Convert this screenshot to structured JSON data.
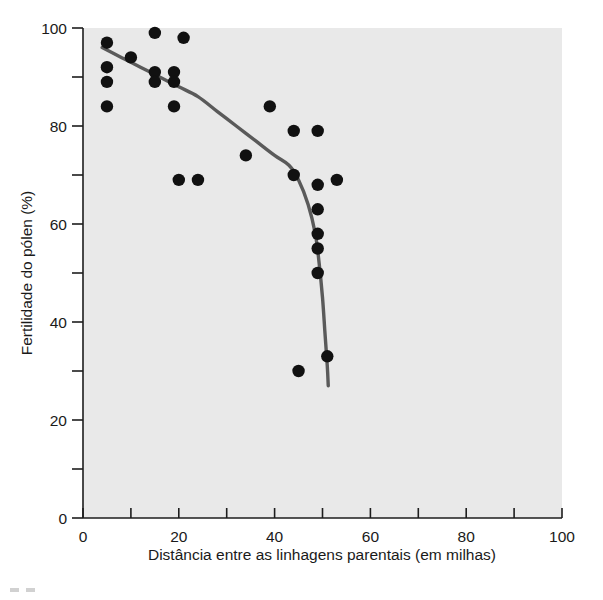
{
  "figure": {
    "background_color": "#ffffff",
    "plot_background_color": "#e9e9e9",
    "point_color": "#111111",
    "curve_color": "#5a5a5a",
    "axis_color": "#1d1d1d"
  },
  "chart_data": {
    "type": "scatter",
    "title": "",
    "xlabel": "Distância entre as linhagens parentais (em milhas)",
    "ylabel": "Fertilidade do pólen (%)",
    "xlim": [
      0,
      100
    ],
    "ylim": [
      0,
      100
    ],
    "grid": false,
    "legend": "none",
    "x_major_ticks": [
      0,
      20,
      40,
      60,
      80,
      100
    ],
    "x_minor_ticks": [
      10,
      30,
      50,
      70,
      90
    ],
    "x_tick_labels": [
      "0",
      "20",
      "40",
      "60",
      "80",
      "100"
    ],
    "y_major_ticks": [
      0,
      20,
      40,
      60,
      80,
      100
    ],
    "y_minor_ticks": [
      10,
      30,
      50,
      70,
      90
    ],
    "y_tick_labels": [
      "0",
      "20",
      "40",
      "60",
      "80",
      "100"
    ],
    "series": [
      {
        "name": "Fertilidade do pólen",
        "marker": "filled-circle",
        "points": [
          {
            "x": 5,
            "y": 97
          },
          {
            "x": 5,
            "y": 92
          },
          {
            "x": 5,
            "y": 89
          },
          {
            "x": 5,
            "y": 84
          },
          {
            "x": 10,
            "y": 94
          },
          {
            "x": 15,
            "y": 99
          },
          {
            "x": 15,
            "y": 91
          },
          {
            "x": 15,
            "y": 89
          },
          {
            "x": 19,
            "y": 91
          },
          {
            "x": 19,
            "y": 89
          },
          {
            "x": 19,
            "y": 84
          },
          {
            "x": 20,
            "y": 69
          },
          {
            "x": 21,
            "y": 98
          },
          {
            "x": 24,
            "y": 69
          },
          {
            "x": 34,
            "y": 74
          },
          {
            "x": 39,
            "y": 84
          },
          {
            "x": 44,
            "y": 79
          },
          {
            "x": 44,
            "y": 70
          },
          {
            "x": 45,
            "y": 30
          },
          {
            "x": 49,
            "y": 79
          },
          {
            "x": 49,
            "y": 68
          },
          {
            "x": 49,
            "y": 63
          },
          {
            "x": 49,
            "y": 58
          },
          {
            "x": 49,
            "y": 55
          },
          {
            "x": 49,
            "y": 50
          },
          {
            "x": 51,
            "y": 33
          },
          {
            "x": 53,
            "y": 69
          }
        ]
      }
    ],
    "fit_curve": {
      "name": "curva ajustada",
      "points": [
        {
          "x": 4,
          "y": 96
        },
        {
          "x": 8,
          "y": 94
        },
        {
          "x": 12,
          "y": 92
        },
        {
          "x": 16,
          "y": 90
        },
        {
          "x": 20,
          "y": 88
        },
        {
          "x": 24,
          "y": 86
        },
        {
          "x": 28,
          "y": 83
        },
        {
          "x": 32,
          "y": 80
        },
        {
          "x": 36,
          "y": 77
        },
        {
          "x": 40,
          "y": 74
        },
        {
          "x": 43,
          "y": 72
        },
        {
          "x": 45,
          "y": 69
        },
        {
          "x": 47,
          "y": 64
        },
        {
          "x": 48.5,
          "y": 58
        },
        {
          "x": 49.3,
          "y": 52
        },
        {
          "x": 50.0,
          "y": 45
        },
        {
          "x": 50.5,
          "y": 38
        },
        {
          "x": 51.0,
          "y": 31
        },
        {
          "x": 51.2,
          "y": 27
        }
      ]
    }
  }
}
